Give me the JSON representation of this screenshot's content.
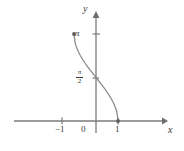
{
  "figure": {
    "kind": "cartesian-plot",
    "width": 184,
    "height": 151,
    "background": "#ffffff",
    "ink_color": "#6e6e6e",
    "text_color": "#3a3a3a"
  },
  "axes": {
    "x_axis_label": "x",
    "y_axis_label": "y",
    "origin_label": "0",
    "x_ticks": [
      {
        "value": -1,
        "label": "−1"
      },
      {
        "value": 1,
        "label": "1"
      }
    ],
    "y_ticks": [
      {
        "value": 1.5707963,
        "label": "π/2",
        "numerator": "π",
        "denominator": "2",
        "stacked": true
      },
      {
        "value": 3.1415927,
        "label": "π",
        "stacked": false
      }
    ]
  },
  "chart_data": {
    "type": "line",
    "title": "",
    "subtitle": "",
    "xlabel": "x",
    "ylabel": "y",
    "xlim": [
      -1.45,
      1.45
    ],
    "ylim": [
      -0.35,
      3.75
    ],
    "grid": false,
    "legend": null,
    "series": [
      {
        "name": "y = arccos(x)",
        "x": [
          -1.0,
          -0.95,
          -0.9,
          -0.8,
          -0.7,
          -0.6,
          -0.5,
          -0.4,
          -0.3,
          -0.2,
          -0.1,
          0.0,
          0.1,
          0.2,
          0.3,
          0.4,
          0.5,
          0.6,
          0.7,
          0.8,
          0.9,
          0.95,
          1.0
        ],
        "y": [
          3.1416,
          2.8242,
          2.6906,
          2.4981,
          2.3462,
          2.2143,
          2.0944,
          1.9823,
          1.8755,
          1.7722,
          1.671,
          1.5708,
          1.4706,
          1.3694,
          1.2661,
          1.1593,
          1.0472,
          0.9273,
          0.7954,
          0.6435,
          0.451,
          0.3176,
          0.0
        ]
      }
    ],
    "endpoints": [
      {
        "x": -1,
        "y": 3.1415927,
        "marker": "dot",
        "filled": true
      },
      {
        "x": 1,
        "y": 0,
        "marker": "dot",
        "filled": true
      }
    ],
    "annotations": [
      {
        "text": "π",
        "x": 0,
        "y": 3.1415927,
        "placement": "left-of-y-axis"
      },
      {
        "text": "π/2",
        "x": 0,
        "y": 1.5707963,
        "placement": "left-of-y-axis"
      },
      {
        "text": "−1",
        "x": -1,
        "y": 0,
        "placement": "below-x-axis"
      },
      {
        "text": "0",
        "x": 0,
        "y": 0,
        "placement": "below-left-of-origin"
      },
      {
        "text": "1",
        "x": 1,
        "y": 0,
        "placement": "below-x-axis"
      }
    ]
  }
}
